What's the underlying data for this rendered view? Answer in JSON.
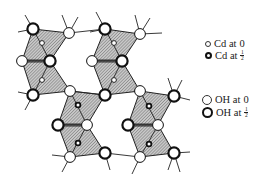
{
  "figure": {
    "hatch_color": "#9a9a9a",
    "line_color": "#222222",
    "fill_color": "#ffffff"
  },
  "legend": {
    "items": [
      {
        "symbol": "small-open-circle",
        "label": "Cd at 0",
        "text": "Cd at",
        "value": "0"
      },
      {
        "symbol": "small-bold-circle",
        "label": "Cd at 1/2",
        "text": "Cd at",
        "num": "1",
        "den": "2"
      },
      {
        "symbol": "large-open-circle",
        "label": "OH at 0",
        "text": "OH at",
        "value": "0"
      },
      {
        "symbol": "large-bold-circle",
        "label": "OH at 1/2",
        "text": "OH at",
        "num": "1",
        "den": "2"
      }
    ]
  },
  "blocks": [
    {
      "id": "top-left",
      "oh": [
        [
          33,
          29,
          1
        ],
        [
          69,
          33,
          0
        ],
        [
          22,
          61,
          0
        ],
        [
          50,
          61,
          1
        ],
        [
          33,
          95,
          1
        ],
        [
          70,
          91,
          0
        ]
      ],
      "cd": [
        [
          42,
          43,
          0
        ],
        [
          42,
          80,
          0
        ]
      ]
    },
    {
      "id": "top-middle",
      "oh": [
        [
          105,
          29,
          1
        ],
        [
          140,
          34,
          0
        ],
        [
          92,
          61,
          0
        ],
        [
          122,
          61,
          1
        ],
        [
          105,
          95,
          1
        ],
        [
          140,
          91,
          0
        ]
      ],
      "cd": [
        [
          114,
          43,
          0
        ],
        [
          114,
          80,
          0
        ]
      ]
    },
    {
      "id": "bottom-left",
      "oh": [
        [
          70,
          91,
          0
        ],
        [
          105,
          95,
          1
        ],
        [
          58,
          125,
          1
        ],
        [
          87,
          125,
          0
        ],
        [
          70,
          157,
          0
        ],
        [
          105,
          153,
          1
        ]
      ],
      "cd": [
        [
          78,
          105,
          1
        ],
        [
          78,
          143,
          1
        ]
      ]
    },
    {
      "id": "bottom-right",
      "oh": [
        [
          140,
          91,
          0
        ],
        [
          174,
          96,
          1
        ],
        [
          128,
          125,
          1
        ],
        [
          158,
          125,
          0
        ],
        [
          140,
          157,
          0
        ],
        [
          174,
          153,
          1
        ]
      ],
      "cd": [
        [
          149,
          106,
          1
        ],
        [
          149,
          144,
          1
        ]
      ]
    }
  ],
  "bonds": [
    [
      33,
      29,
      18,
      32
    ],
    [
      33,
      29,
      25,
      15
    ],
    [
      69,
      33,
      62,
      15
    ],
    [
      69,
      33,
      78,
      17
    ],
    [
      69,
      33,
      105,
      29
    ],
    [
      105,
      29,
      96,
      12
    ],
    [
      105,
      29,
      90,
      32
    ],
    [
      140,
      34,
      135,
      15
    ],
    [
      140,
      34,
      150,
      18
    ],
    [
      140,
      34,
      162,
      33
    ],
    [
      33,
      95,
      18,
      92
    ],
    [
      33,
      95,
      25,
      110
    ],
    [
      70,
      91,
      105,
      95
    ],
    [
      174,
      96,
      168,
      78
    ],
    [
      174,
      96,
      182,
      80
    ],
    [
      174,
      96,
      190,
      100
    ],
    [
      70,
      157,
      52,
      155
    ],
    [
      70,
      157,
      62,
      172
    ],
    [
      105,
      153,
      110,
      170
    ],
    [
      105,
      153,
      140,
      157
    ],
    [
      140,
      157,
      132,
      174
    ],
    [
      174,
      153,
      168,
      170
    ],
    [
      174,
      153,
      180,
      172
    ],
    [
      174,
      153,
      190,
      152
    ]
  ]
}
